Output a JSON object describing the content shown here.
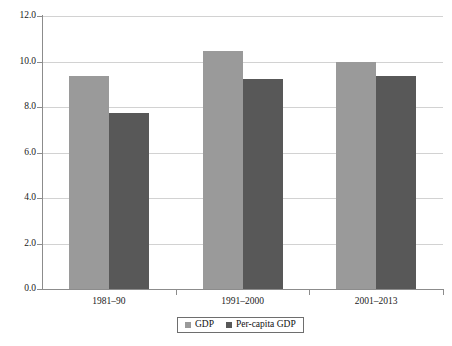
{
  "chart_data": {
    "type": "bar",
    "title": "",
    "subtitle": "",
    "xlabel": "",
    "ylabel": "",
    "categories": [
      "1981–90",
      "1991–2000",
      "2001–2013"
    ],
    "series": [
      {
        "name": "GDP",
        "values": [
          9.35,
          10.45,
          10.0
        ],
        "color": "#9a9a9a"
      },
      {
        "name": "Per-capita GDP",
        "values": [
          7.75,
          9.25,
          9.35
        ],
        "color": "#585858"
      }
    ],
    "ylim": [
      0.0,
      12.0
    ],
    "ytick_values": [
      0.0,
      2.0,
      4.0,
      6.0,
      8.0,
      10.0,
      12.0
    ],
    "ytick_labels": [
      "0.0",
      "2.0",
      "4.0",
      "6.0",
      "8.0",
      "10.0",
      "12.0"
    ],
    "grid": true,
    "grid_axis": "y",
    "legend_position": "bottom-center",
    "annotations": []
  },
  "legend": {
    "entries": [
      {
        "label": "GDP",
        "color": "#9a9a9a"
      },
      {
        "label": "Per-capita GDP",
        "color": "#585858"
      }
    ]
  },
  "colors": {
    "gdp": "#9a9a9a",
    "per_capita_gdp": "#585858",
    "grid": "#d2d2d2",
    "axis": "#8c8c8c",
    "background": "#ffffff",
    "text": "#1a1a1a"
  }
}
